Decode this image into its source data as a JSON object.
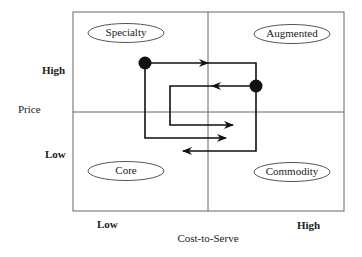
{
  "quadrants": {
    "top_left": "Specialty",
    "top_right": "Augmented",
    "bottom_left": "Core",
    "bottom_right": "Commodity"
  },
  "y_axis": {
    "title": "Price",
    "high": "High",
    "low": "Low"
  },
  "x_axis": {
    "title": "Cost-to-Serve",
    "low": "Low",
    "high": "High"
  },
  "colors": {
    "line": "#111111",
    "grid": "#555555",
    "text": "#222222"
  }
}
